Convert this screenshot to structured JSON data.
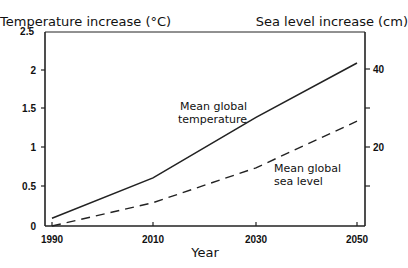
{
  "chart_data": {
    "type": "line",
    "title": "",
    "xlabel": "Year",
    "ylabel": "Temperature increase (°C)",
    "y2label": "Sea level increase (cm)",
    "x": [
      1990,
      2010,
      2030,
      2050
    ],
    "xticks": [
      "1990",
      "2010",
      "2030",
      "2050"
    ],
    "yticks": [
      "0",
      "0.5",
      "1",
      "1.5",
      "2",
      "2.5"
    ],
    "y2ticks": [
      "20",
      "40"
    ],
    "ylim": [
      0,
      2.5
    ],
    "y2lim": [
      0,
      50
    ],
    "grid": false,
    "legend": "inline annotations",
    "series": [
      {
        "name": "Mean global temperature",
        "axis": "left",
        "unit": "°C",
        "style": "solid",
        "values": [
          0.1,
          0.62,
          1.4,
          2.1
        ]
      },
      {
        "name": "Mean global sea level",
        "axis": "right",
        "unit": "cm",
        "style": "dashed",
        "values": [
          0,
          6,
          15,
          27
        ]
      }
    ],
    "annotations": [
      {
        "text": [
          "Mean global",
          "temperature"
        ],
        "series": "Mean global temperature"
      },
      {
        "text": [
          "Mean global",
          "sea level"
        ],
        "series": "Mean global sea level"
      }
    ]
  },
  "labels": {
    "left_axis_title": "Temperature increase (°C)",
    "right_axis_title": "Sea level increase (cm)",
    "x_axis_title": "Year",
    "temp_line1": "Mean global",
    "temp_line2": "temperature",
    "sea_line1": "Mean global",
    "sea_line2": "sea level"
  }
}
